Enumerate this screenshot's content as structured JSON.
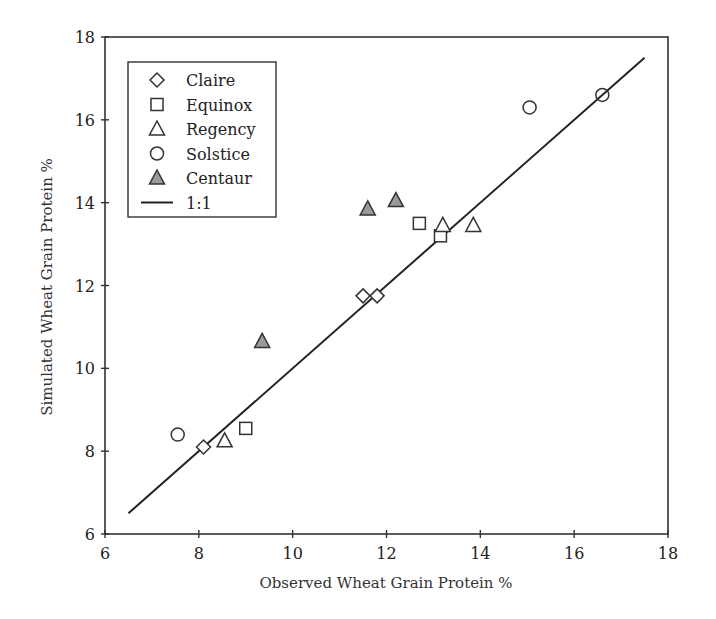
{
  "chart_data": {
    "type": "scatter",
    "title": "",
    "xlabel": "Observed Wheat Grain Protein %",
    "ylabel": "Simulated Wheat Grain Protein %",
    "xlim": [
      6,
      18
    ],
    "ylim": [
      6,
      18
    ],
    "xticks": [
      6,
      8,
      10,
      12,
      14,
      16,
      18
    ],
    "yticks": [
      6,
      8,
      10,
      12,
      14,
      16,
      18
    ],
    "grid": false,
    "legend_position": "upper-left (inside)",
    "series": [
      {
        "name": "Claire",
        "marker": "diamond-open",
        "points": [
          [
            8.1,
            8.1
          ],
          [
            11.5,
            11.75
          ],
          [
            11.8,
            11.75
          ]
        ]
      },
      {
        "name": "Equinox",
        "marker": "square-open",
        "points": [
          [
            9.0,
            8.55
          ],
          [
            12.7,
            13.5
          ],
          [
            13.15,
            13.2
          ]
        ]
      },
      {
        "name": "Regency",
        "marker": "triangle-open",
        "points": [
          [
            8.55,
            8.25
          ],
          [
            13.2,
            13.45
          ],
          [
            13.85,
            13.45
          ]
        ]
      },
      {
        "name": "Solstice",
        "marker": "circle-open",
        "points": [
          [
            7.55,
            8.4
          ],
          [
            15.05,
            16.3
          ],
          [
            16.6,
            16.6
          ]
        ]
      },
      {
        "name": "Centaur",
        "marker": "triangle-filled",
        "fill": "#9a9a9a",
        "points": [
          [
            9.35,
            10.65
          ],
          [
            11.6,
            13.85
          ],
          [
            12.2,
            14.05
          ]
        ]
      }
    ],
    "reference_line": {
      "name": "1:1",
      "from": [
        6.5,
        6.5
      ],
      "to": [
        17.5,
        17.5
      ]
    }
  },
  "legend": {
    "items": [
      {
        "label": "Claire",
        "marker": "diamond-open"
      },
      {
        "label": "Equinox",
        "marker": "square-open"
      },
      {
        "label": "Regency",
        "marker": "triangle-open"
      },
      {
        "label": "Solstice",
        "marker": "circle-open"
      },
      {
        "label": "Centaur",
        "marker": "triangle-filled"
      },
      {
        "label": "1:1",
        "marker": "line"
      }
    ]
  },
  "colors": {
    "axis": "#333333",
    "marker_stroke": "#333333",
    "centaur_fill": "#9a9a9a",
    "line": "#222222"
  }
}
